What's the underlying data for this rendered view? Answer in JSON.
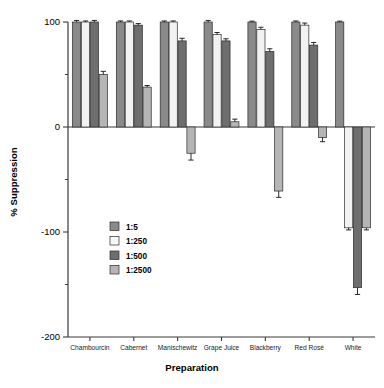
{
  "chart_data": {
    "type": "bar",
    "title": "",
    "xlabel": "Preparation",
    "ylabel": "% Suppression",
    "categories": [
      "Chambourcin",
      "Cabernet",
      "Manischewitz",
      "Grape Juice",
      "Blackberry",
      "Red Rosé",
      "White"
    ],
    "ylim": [
      -200,
      100
    ],
    "yticks": [
      100,
      0,
      -100,
      -200
    ],
    "yticklabels": [
      "100",
      "0",
      "-100",
      "-200"
    ],
    "yticks_minor": [
      50,
      -50,
      -150
    ],
    "grid": false,
    "legend_position": "inside-left",
    "series": [
      {
        "name": "1:5",
        "color": "#8a8a8a",
        "values": [
          100,
          100,
          100,
          100,
          100,
          100,
          100
        ],
        "errors": [
          1.5,
          1.0,
          1.0,
          1.5,
          0.8,
          1.0,
          0.8
        ]
      },
      {
        "name": "1:250",
        "color": "#f2f2f2",
        "values": [
          100,
          100,
          100,
          88,
          93,
          97,
          -96
        ],
        "errors": [
          1.0,
          1.0,
          1.0,
          2.0,
          2.0,
          2.0,
          2.0
        ]
      },
      {
        "name": "1:500",
        "color": "#6e6e6e",
        "values": [
          100,
          97,
          82,
          82,
          72,
          78,
          -153
        ],
        "errors": [
          1.5,
          1.5,
          2.5,
          2.0,
          2.5,
          2.5,
          6.5
        ]
      },
      {
        "name": "1:2500",
        "color": "#b5b5b5",
        "values": [
          50,
          38,
          -25,
          5,
          -61,
          -10,
          -96
        ],
        "errors": [
          3.0,
          1.5,
          6.5,
          2.5,
          6.0,
          4.0,
          2.0
        ]
      }
    ]
  },
  "legend": {
    "items": [
      {
        "label": "1:5",
        "color": "#8a8a8a"
      },
      {
        "label": "1:250",
        "color": "#f8f8f8"
      },
      {
        "label": "1:500",
        "color": "#6e6e6e"
      },
      {
        "label": "1:2500",
        "color": "#b5b5b5"
      }
    ]
  }
}
